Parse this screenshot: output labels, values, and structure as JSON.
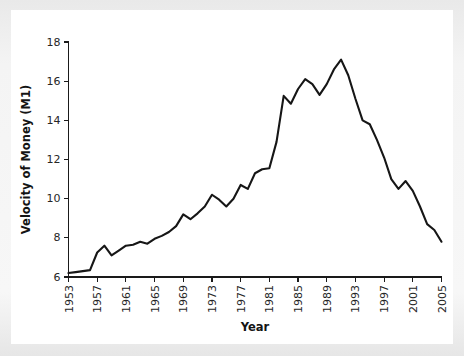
{
  "figure": {
    "background_color": "#f2f2f2",
    "paper_color": "#ffffff",
    "line_color": "#161616",
    "axis_color": "#1a1a1a",
    "text_color": "#262626"
  },
  "chart_data": {
    "type": "line",
    "title": "",
    "xlabel": "Year",
    "ylabel": "Velocity of Money (M1)",
    "xlim": [
      1953,
      2005
    ],
    "ylim": [
      6,
      18
    ],
    "grid": false,
    "legend": null,
    "xticks": [
      1953,
      1957,
      1961,
      1965,
      1969,
      1973,
      1977,
      1981,
      1985,
      1989,
      1993,
      1997,
      2001,
      2005
    ],
    "xtick_labels": [
      "1953",
      "1957",
      "1961",
      "1965",
      "1969",
      "1973",
      "1977",
      "1981",
      "1985",
      "1989",
      "1993",
      "1997",
      "2001",
      "2005"
    ],
    "xtick_rotation": 90,
    "yticks": [
      6,
      8,
      10,
      12,
      14,
      16,
      18
    ],
    "ytick_labels": [
      "6",
      "8",
      "10",
      "12",
      "14",
      "16",
      "18"
    ],
    "series": [
      {
        "name": "Velocity of Money (M1)",
        "x": [
          1953,
          1954,
          1955,
          1956,
          1957,
          1958,
          1959,
          1960,
          1961,
          1962,
          1963,
          1964,
          1965,
          1966,
          1967,
          1968,
          1969,
          1970,
          1971,
          1972,
          1973,
          1974,
          1975,
          1976,
          1977,
          1978,
          1979,
          1980,
          1981,
          1982,
          1983,
          1984,
          1985,
          1986,
          1987,
          1988,
          1989,
          1990,
          1991,
          1992,
          1993,
          1994,
          1995,
          1996,
          1997,
          1998,
          1999,
          2000,
          2001,
          2002,
          2003,
          2004,
          2005
        ],
        "values": [
          6.2,
          6.25,
          6.3,
          6.35,
          7.25,
          7.6,
          7.1,
          7.35,
          7.6,
          7.65,
          7.8,
          7.7,
          7.95,
          8.1,
          8.3,
          8.6,
          9.2,
          8.95,
          9.25,
          9.6,
          10.2,
          9.95,
          9.6,
          10.0,
          10.7,
          10.5,
          11.3,
          11.5,
          11.55,
          12.9,
          15.25,
          14.85,
          15.6,
          16.1,
          15.85,
          15.3,
          15.85,
          16.6,
          17.1,
          16.3,
          15.1,
          14.0,
          13.8,
          13.0,
          12.1,
          11.0,
          10.5,
          10.9,
          10.4,
          9.6,
          8.7,
          8.4,
          7.8
        ],
        "color": "#161616",
        "linewidth": 2.1,
        "marker": "none"
      }
    ],
    "annotations": []
  }
}
